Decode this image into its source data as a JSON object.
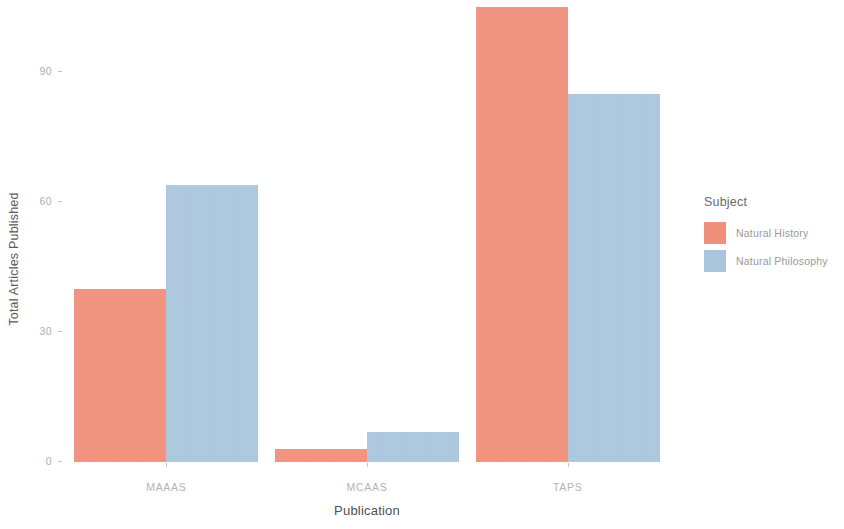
{
  "chart_data": {
    "type": "bar",
    "title": "",
    "xlabel": "Publication",
    "ylabel": "Total Articles Published",
    "categories": [
      "MAAAS",
      "MCAAS",
      "TAPS"
    ],
    "series": [
      {
        "name": "Natural History",
        "color": "#f0907c",
        "values": [
          40,
          3,
          105
        ]
      },
      {
        "name": "Natural Philosophy",
        "color": "#aac6dd",
        "values": [
          64,
          7,
          85
        ]
      }
    ],
    "legend_title": "Subject",
    "legend_position": "right",
    "grid": false,
    "ylim": [
      0,
      108
    ],
    "yticks": [
      0,
      30,
      60,
      90
    ],
    "ytick_labels": [
      "0",
      "30",
      "60",
      "90"
    ]
  }
}
